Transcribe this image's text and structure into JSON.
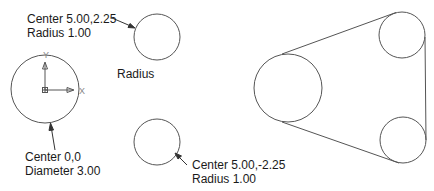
{
  "labels": {
    "top_circle": {
      "line1": "Center 5.00,2.25",
      "line2": "Radius  1.00"
    },
    "radius_caption": "Radius",
    "origin_circle": {
      "line1": "Center 0,0",
      "line2": "Diameter 3.00"
    },
    "bottom_circle": {
      "line1": "Center 5.00,-2.25",
      "line2": "Radius  1.00"
    },
    "axis_x": "X",
    "axis_y": "Y"
  },
  "colors": {
    "stroke": "#555555",
    "text": "#1a1a1a"
  }
}
